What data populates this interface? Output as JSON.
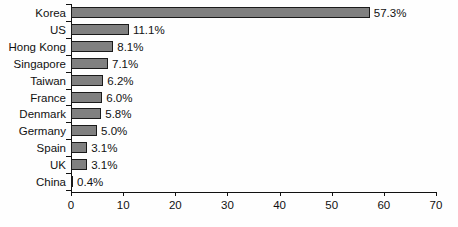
{
  "chart_data": {
    "type": "bar",
    "orientation": "horizontal",
    "title": "",
    "subtitle": "",
    "xlabel": "",
    "ylabel": "",
    "categories": [
      "Korea",
      "US",
      "Hong Kong",
      "Singapore",
      "Taiwan",
      "France",
      "Denmark",
      "Germany",
      "Spain",
      "UK",
      "China"
    ],
    "values": [
      57.3,
      11.1,
      8.1,
      7.1,
      6.2,
      6.0,
      5.8,
      5.0,
      3.1,
      3.1,
      0.4
    ],
    "data_labels": [
      "57.3%",
      "11.1%",
      "8.1%",
      "7.1%",
      "6.2%",
      "6.0%",
      "5.8%",
      "5.0%",
      "3.1%",
      "3.1%",
      "0.4%"
    ],
    "xlim": [
      0,
      70
    ],
    "xticks": [
      0,
      10,
      20,
      30,
      40,
      50,
      60,
      70
    ],
    "xtick_labels": [
      "0",
      "10",
      "20",
      "30",
      "40",
      "50",
      "60",
      "70"
    ],
    "grid": false,
    "legend": null,
    "bar_color": "#808080",
    "bar_border_color": "#1a1a1a",
    "axis_color": "#111111",
    "background_color": "#fefefe"
  }
}
